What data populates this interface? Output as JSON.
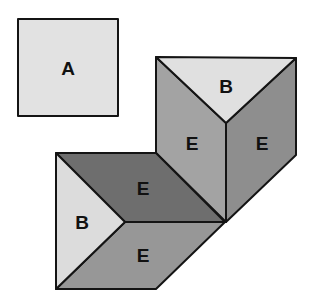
{
  "figure": {
    "pieces": [
      {
        "id": "piece-a",
        "label": "A",
        "shape": "square",
        "color": "#e2e2e2"
      },
      {
        "id": "upper-b",
        "label": "B",
        "shape": "triangle",
        "color": "#e0e0e0"
      },
      {
        "id": "upper-left-e",
        "label": "E",
        "shape": "parallelogram",
        "color": "#a3a3a3"
      },
      {
        "id": "upper-right-e",
        "label": "E",
        "shape": "parallelogram",
        "color": "#8e8e8e"
      },
      {
        "id": "lower-top-e",
        "label": "E",
        "shape": "parallelogram",
        "color": "#6e6e6e"
      },
      {
        "id": "lower-b",
        "label": "B",
        "shape": "triangle",
        "color": "#dcdcdc"
      },
      {
        "id": "lower-bottom-e",
        "label": "E",
        "shape": "parallelogram",
        "color": "#979797"
      }
    ]
  }
}
